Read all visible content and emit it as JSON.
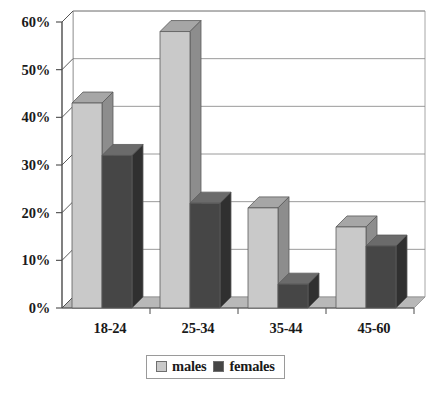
{
  "chart_data": {
    "type": "bar",
    "title": "",
    "subtitle": "",
    "xlabel": "",
    "ylabel": "",
    "categories": [
      "18-24",
      "25-34",
      "35-44",
      "45-60"
    ],
    "series": [
      {
        "name": "males",
        "color": "#c9c9c9",
        "values": [
          43,
          58,
          21,
          17
        ]
      },
      {
        "name": "females",
        "color": "#464646",
        "values": [
          32,
          22,
          5,
          13
        ]
      }
    ],
    "ylim": [
      0,
      60
    ],
    "yticks": [
      0,
      10,
      20,
      30,
      40,
      50,
      60
    ],
    "ytick_labels": [
      "0%",
      "10%",
      "20%",
      "30%",
      "40%",
      "50%",
      "60%"
    ],
    "grid": true,
    "legend_position": "bottom",
    "style": "3d-column"
  },
  "legend": {
    "entries": [
      {
        "label": "males",
        "swatch": "light-gray-swatch-icon"
      },
      {
        "label": "females",
        "swatch": "dark-gray-swatch-icon"
      }
    ]
  },
  "colors": {
    "males_front": "#c9c9c9",
    "males_top": "#a6a6a6",
    "males_side": "#8d8d8d",
    "females_front": "#464646",
    "females_top": "#6b6b6b",
    "females_side": "#303030",
    "grid": "#8f8f8f",
    "axis": "#4a4a4a",
    "floor": "#b8b8b8",
    "background": "#ffffff"
  }
}
